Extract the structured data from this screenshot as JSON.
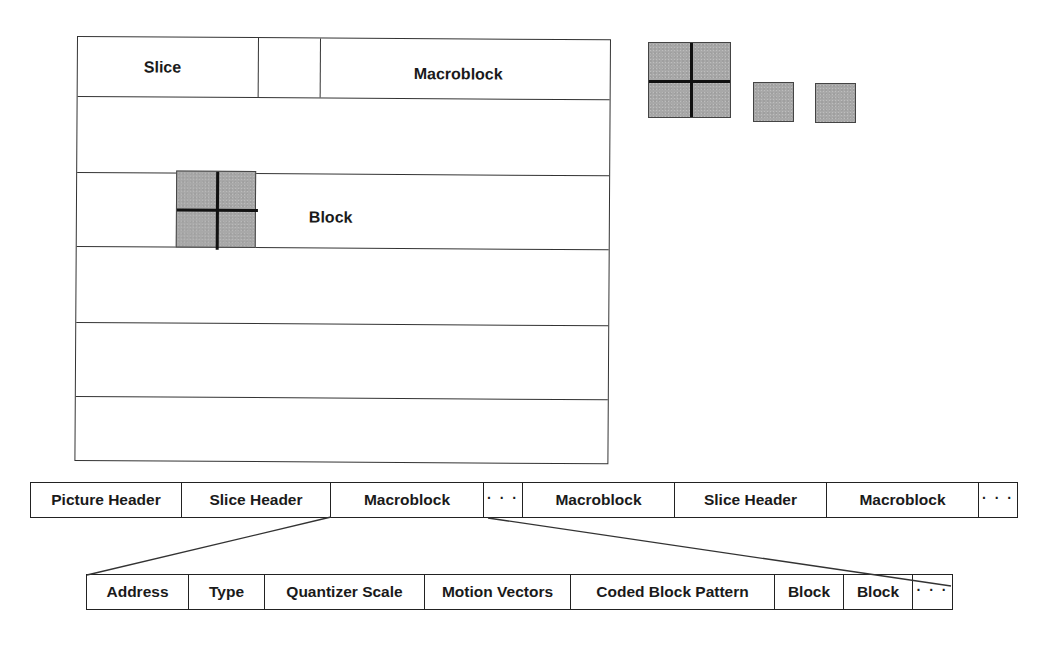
{
  "diagram": {
    "type": "MPEG picture structure and bitstream hierarchy",
    "picture_frame": {
      "labels": {
        "slice": "Slice",
        "macroblock": "Macroblock",
        "block": "Block"
      },
      "row_count": 6
    },
    "block_legend": {
      "macroblock_quad": "2x2 luminance macroblock",
      "chroma_blocks": 2
    },
    "picture_stream": {
      "cells": [
        "Picture Header",
        "Slice Header",
        "Macroblock",
        "· · ·",
        "Macroblock",
        "Slice Header",
        "Macroblock",
        "· · ·"
      ]
    },
    "macroblock_stream": {
      "cells": [
        "Address",
        "Type",
        "Quantizer Scale",
        "Motion Vectors",
        "Coded Block Pattern",
        "Block",
        "Block",
        "· · ·"
      ]
    },
    "colors": {
      "line": "#222222",
      "block_fill": "#a8a8a8",
      "background": "#ffffff"
    }
  }
}
